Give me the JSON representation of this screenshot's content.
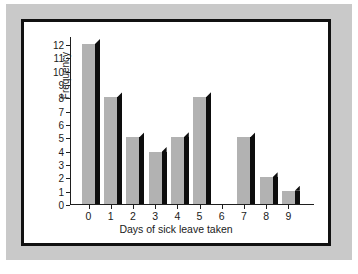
{
  "figure": {
    "mat_color": "#c9c9c9",
    "panel_color": "#ffffff",
    "frame_color": "#111111",
    "bar_face_color": "#b2b2b2",
    "bar_shadow_color": "#0d0d0d"
  },
  "chart_data": {
    "type": "bar",
    "title": "",
    "xlabel": "Days of sick leave taken",
    "ylabel": "Frequency",
    "categories": [
      "0",
      "1",
      "2",
      "3",
      "4",
      "5",
      "6",
      "7",
      "8",
      "9"
    ],
    "values": [
      12,
      8,
      5,
      3.9,
      5,
      8,
      0,
      5,
      2,
      1
    ],
    "x_tick_labels": [
      "0",
      "1",
      "2",
      "3",
      "4",
      "5",
      "6",
      "7",
      "8",
      "9"
    ],
    "y_tick_labels": [
      "0",
      "1",
      "2",
      "3",
      "4",
      "5",
      "6",
      "7",
      "8",
      "9",
      "10",
      "11",
      "12"
    ],
    "y_tick_values": [
      0,
      1,
      2,
      3,
      4,
      5,
      6,
      7,
      8,
      9,
      10,
      11,
      12
    ],
    "ylim": [
      0,
      12.6
    ],
    "xlim": [
      -0.5,
      9.5
    ],
    "grid": false,
    "legend": false,
    "legend_position": "none",
    "series": [
      {
        "name": "Frequency",
        "values": [
          12,
          8,
          5,
          3.9,
          5,
          8,
          0,
          5,
          2,
          1
        ]
      }
    ],
    "annotations": []
  }
}
